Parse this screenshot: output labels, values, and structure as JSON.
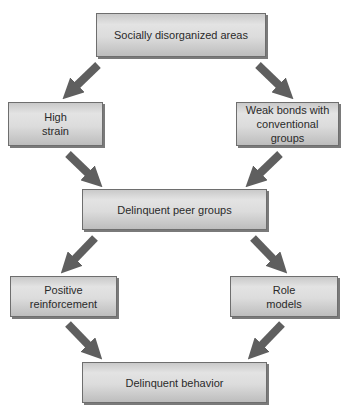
{
  "nodes": {
    "top": "Socially disorganized areas",
    "high_strain": "High\nstrain",
    "weak_bonds": "Weak bonds with\nconventional groups",
    "peer_groups": "Delinquent peer groups",
    "positive_reinforcement": "Positive\nreinforcement",
    "role_models": "Role\nmodels",
    "behavior": "Delinquent behavior"
  },
  "colors": {
    "arrow": "#5f5f5f",
    "box_border": "#6e6e6e"
  }
}
